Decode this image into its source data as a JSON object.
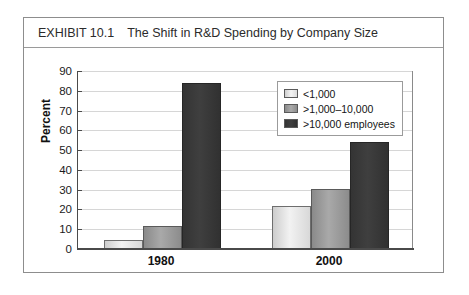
{
  "exhibit": {
    "label": "EXHIBIT 10.1",
    "title": "The Shift in R&D Spending by Company Size"
  },
  "chart_data": {
    "type": "bar",
    "title": "The Shift in R&D Spending by Company Size",
    "xlabel": "",
    "ylabel": "Percent",
    "categories": [
      "1980",
      "2000"
    ],
    "series": [
      {
        "name": "<1,000",
        "values": [
          4.5,
          22
        ]
      },
      {
        "name": ">1,000–10,000",
        "values": [
          11.5,
          30.5
        ]
      },
      {
        "name": ">10,000 employees",
        "values": [
          84,
          54
        ]
      }
    ],
    "ylim": [
      0,
      90
    ],
    "yticks": [
      0,
      10,
      20,
      30,
      40,
      50,
      60,
      70,
      80,
      90
    ],
    "ytick_labels": [
      "0",
      "10",
      "20",
      "30",
      "40",
      "50",
      "60",
      "70",
      "80",
      "90"
    ],
    "grid": true,
    "legend_position": "top-right",
    "colors": {
      "series_0": "#e2e2e2",
      "series_1": "#9a9a9a",
      "series_2": "#373737",
      "axis": "#4a4a4a",
      "gridline": "#d6d6d6",
      "frame": "#8d8d8d"
    }
  }
}
